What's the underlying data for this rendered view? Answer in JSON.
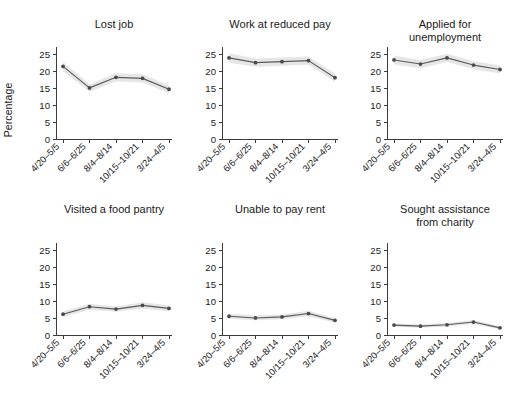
{
  "figure": {
    "ylabel": "Percentage",
    "background": "#ffffff",
    "line_color": "#5a5a5a",
    "band_color": "#e6e6e6"
  },
  "chart_data": {
    "type": "line",
    "title": "",
    "xlabel": "",
    "ylabel": "Percentage",
    "ylim": [
      0,
      27
    ],
    "yticks": [
      0,
      5,
      10,
      15,
      20,
      25
    ],
    "grid": false,
    "legend": "none",
    "layout": {
      "rows": 2,
      "cols": 3
    },
    "x": [
      "4/20–5/5",
      "6/6–6/25",
      "8/4–8/14",
      "10/15–10/21",
      "3/24–4/5"
    ],
    "categories": [
      "4/20–5/5",
      "6/6–6/25",
      "8/4–8/14",
      "10/15–10/21",
      "3/24–4/5"
    ],
    "panels": [
      {
        "title": "Lost job",
        "values": [
          21.3,
          15.0,
          18.1,
          17.8,
          14.6
        ],
        "lower": [
          19.9,
          13.9,
          16.9,
          16.6,
          13.4
        ],
        "upper": [
          22.7,
          16.1,
          19.3,
          19.0,
          15.8
        ]
      },
      {
        "title": "Work at reduced pay",
        "values": [
          23.8,
          22.4,
          22.7,
          23.0,
          18.0
        ],
        "lower": [
          22.4,
          21.2,
          21.5,
          21.8,
          16.8
        ],
        "upper": [
          25.2,
          23.6,
          23.9,
          24.2,
          19.2
        ]
      },
      {
        "title": "Applied for\nunemployment",
        "values": [
          23.2,
          22.0,
          23.8,
          21.7,
          20.4
        ],
        "lower": [
          21.9,
          20.8,
          22.6,
          20.5,
          19.2
        ],
        "upper": [
          24.5,
          23.2,
          25.0,
          22.9,
          21.6
        ]
      },
      {
        "title": "Visited a food pantry",
        "values": [
          6.1,
          8.3,
          7.6,
          8.7,
          7.8
        ],
        "lower": [
          5.3,
          7.4,
          6.8,
          7.8,
          6.9
        ],
        "upper": [
          6.9,
          9.2,
          8.4,
          9.6,
          8.7
        ]
      },
      {
        "title": "Unable to pay rent",
        "values": [
          5.5,
          5.0,
          5.3,
          6.3,
          4.3
        ],
        "lower": [
          4.8,
          4.3,
          4.6,
          5.5,
          3.6
        ],
        "upper": [
          6.2,
          5.7,
          6.0,
          7.1,
          5.0
        ]
      },
      {
        "title": "Sought assistance\nfrom charity",
        "values": [
          2.9,
          2.6,
          3.0,
          3.8,
          2.1
        ],
        "lower": [
          2.4,
          2.1,
          2.5,
          3.2,
          1.6
        ],
        "upper": [
          3.4,
          3.1,
          3.5,
          4.4,
          2.6
        ]
      }
    ]
  }
}
